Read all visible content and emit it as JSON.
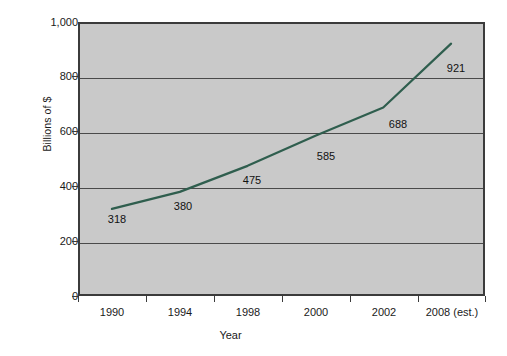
{
  "chart_data": {
    "type": "line",
    "title": "",
    "xlabel": "Year",
    "ylabel": "Billions of $",
    "categories": [
      "1990",
      "1994",
      "1998",
      "2000",
      "2002",
      "2008 (est.)"
    ],
    "values": [
      318,
      380,
      475,
      585,
      688,
      921
    ],
    "point_labels": [
      "318",
      "380",
      "475",
      "585",
      "688",
      "921"
    ],
    "ylim": [
      0,
      1000
    ],
    "yticks": [
      0,
      200,
      400,
      600,
      800,
      1000
    ],
    "ytick_labels": [
      "0",
      "200",
      "400",
      "600",
      "800",
      "1,000"
    ],
    "grid": true,
    "legend": null,
    "series": [
      {
        "name": "",
        "values": [
          318,
          380,
          475,
          585,
          688,
          921
        ],
        "color": "#2f5e4e"
      }
    ]
  },
  "axes": {
    "y_title": "Billions of $",
    "x_title": "Year",
    "y_labels": [
      "1,000",
      "800",
      "600",
      "400",
      "200",
      "0"
    ],
    "x_labels": [
      "1990",
      "1994",
      "1998",
      "2000",
      "2002",
      "2008 (est.)"
    ]
  },
  "data_labels": {
    "p0": "318",
    "p1": "380",
    "p2": "475",
    "p3": "585",
    "p4": "688",
    "p5": "921"
  },
  "colors": {
    "plot_background": "#c9c9c9",
    "frame": "#3b3b3b",
    "gridline": "#4a4a4a",
    "series_line": "#2f5e4e",
    "page_background": "#ffffff",
    "text": "#1a1a1a"
  }
}
